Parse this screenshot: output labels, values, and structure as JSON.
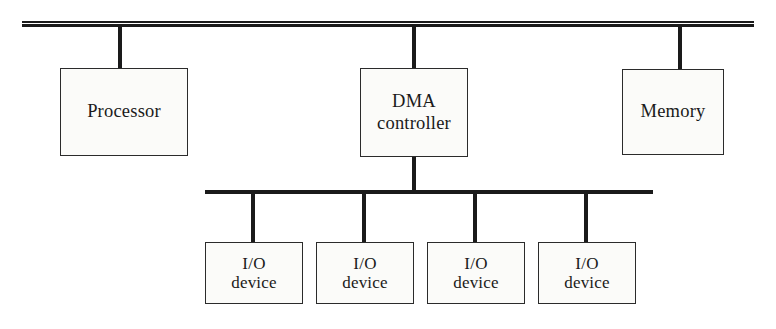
{
  "diagram": {
    "type": "block-diagram",
    "colors": {
      "background": "#ffffff",
      "box_fill": "#fbfbf9",
      "box_stroke": "#2b2b2b",
      "line": "#1a1a1a",
      "text": "#1a1a1a"
    },
    "buses": [
      {
        "name": "system-bus",
        "style": "double-rule",
        "x1": 22,
        "x2": 754,
        "y": 25
      },
      {
        "name": "io-bus",
        "style": "single-rule",
        "x1": 205,
        "x2": 653,
        "y": 192
      }
    ],
    "nodes": [
      {
        "id": "processor",
        "label": "Processor",
        "label_lines": [
          "Processor"
        ],
        "x": 60,
        "y": 68,
        "width": 128,
        "height": 88,
        "connector_x": 120,
        "connects_to": "system-bus",
        "size": "big"
      },
      {
        "id": "dma-controller",
        "label": "DMA controller",
        "label_lines": [
          "DMA",
          "controller"
        ],
        "x": 360,
        "y": 68,
        "width": 108,
        "height": 89,
        "connector_x": 414,
        "connects_to": "system-bus",
        "size": "big"
      },
      {
        "id": "memory",
        "label": "Memory",
        "label_lines": [
          "Memory"
        ],
        "x": 622,
        "y": 69,
        "width": 102,
        "height": 86,
        "connector_x": 680,
        "connects_to": "system-bus",
        "size": "big"
      },
      {
        "id": "io-device-1",
        "label": "I/O device",
        "label_lines": [
          "I/O",
          "device"
        ],
        "x": 205,
        "y": 242,
        "width": 98,
        "height": 62,
        "connector_x": 253,
        "connects_to": "io-bus",
        "size": "io"
      },
      {
        "id": "io-device-2",
        "label": "I/O device",
        "label_lines": [
          "I/O",
          "device"
        ],
        "x": 316,
        "y": 242,
        "width": 98,
        "height": 62,
        "connector_x": 364,
        "connects_to": "io-bus",
        "size": "io"
      },
      {
        "id": "io-device-3",
        "label": "I/O device",
        "label_lines": [
          "I/O",
          "device"
        ],
        "x": 427,
        "y": 242,
        "width": 98,
        "height": 62,
        "connector_x": 475,
        "connects_to": "io-bus",
        "size": "io"
      },
      {
        "id": "io-device-4",
        "label": "I/O device",
        "label_lines": [
          "I/O",
          "device"
        ],
        "x": 538,
        "y": 242,
        "width": 98,
        "height": 62,
        "connector_x": 586,
        "connects_to": "io-bus",
        "size": "io"
      }
    ],
    "links": [
      {
        "name": "processor-to-system-bus",
        "x": 120,
        "y1": 25,
        "y2": 68
      },
      {
        "name": "dma-to-system-bus",
        "x": 414,
        "y1": 25,
        "y2": 68
      },
      {
        "name": "memory-to-system-bus",
        "x": 680,
        "y1": 25,
        "y2": 69
      },
      {
        "name": "dma-to-io-bus",
        "x": 414,
        "y1": 157,
        "y2": 192
      },
      {
        "name": "io-bus-to-io-device-1",
        "x": 253,
        "y1": 192,
        "y2": 242
      },
      {
        "name": "io-bus-to-io-device-2",
        "x": 364,
        "y1": 192,
        "y2": 242
      },
      {
        "name": "io-bus-to-io-device-3",
        "x": 475,
        "y1": 192,
        "y2": 242
      },
      {
        "name": "io-bus-to-io-device-4",
        "x": 586,
        "y1": 192,
        "y2": 242
      }
    ],
    "labels": {
      "processor": "Processor",
      "dma_line1": "DMA",
      "dma_line2": "controller",
      "memory": "Memory",
      "io_line1": "I/O",
      "io_line2": "device"
    }
  }
}
